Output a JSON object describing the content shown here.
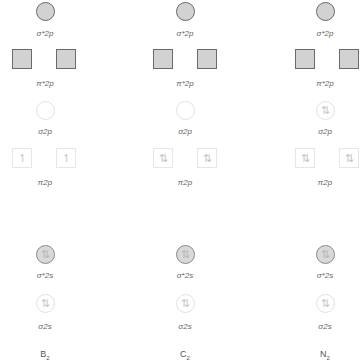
{
  "orbital_labels": {
    "sigma_star_2p": "σ*2p",
    "pi_star_2p": "π*2p",
    "sigma_2p": "σ2p",
    "pi_2p": "π2p",
    "sigma_star_2s": "σ*2s",
    "sigma_2s": "σ2s"
  },
  "molecules": [
    {
      "name": "B",
      "subscript": "2",
      "sigma_star_2p": "",
      "pi_star_2p": [
        "",
        ""
      ],
      "sigma_2p": "",
      "pi_2p": [
        "↿",
        "↿"
      ],
      "sigma_star_2s": "⇅",
      "sigma_2s": "⇅"
    },
    {
      "name": "C",
      "subscript": "2",
      "sigma_star_2p": "",
      "pi_star_2p": [
        "",
        ""
      ],
      "sigma_2p": "",
      "pi_2p": [
        "⇅",
        "⇅"
      ],
      "sigma_star_2s": "⇅",
      "sigma_2s": "⇅"
    },
    {
      "name": "N",
      "subscript": "2",
      "sigma_star_2p": "",
      "pi_star_2p": [
        "",
        ""
      ],
      "sigma_2p": "⇅",
      "pi_2p": [
        "⇅",
        "⇅"
      ],
      "sigma_star_2s": "⇅",
      "sigma_2s": "⇅"
    }
  ]
}
